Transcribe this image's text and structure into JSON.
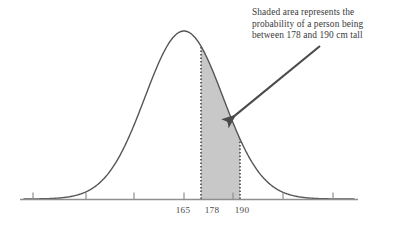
{
  "figure": {
    "title": "",
    "background_color": "#ffffff"
  },
  "annotation": {
    "name": "shaded-area-callout",
    "lines": [
      "Shaded area represents the",
      "probability of a person being",
      "between 178 and 190 cm tall"
    ],
    "full_text": "Shaded area represents the probability of a person being between 178 and 190 cm tall",
    "text_color": "#3a3a3a",
    "arrow": {
      "from_x": 320,
      "from_y": 46,
      "to_x": 221,
      "to_y": 127,
      "color": "#4a4a4a"
    }
  },
  "axis": {
    "line_color": "#8f8f8f",
    "x_start": 20,
    "x_end": 358,
    "baseline_y": 199,
    "tick_color": "#8f8f8f",
    "tick_positions_px": [
      33,
      86,
      134,
      184,
      233,
      283,
      333
    ],
    "labels": [
      {
        "text": "165",
        "x_px": 183
      },
      {
        "text": "178",
        "x_px": 212
      },
      {
        "text": "190",
        "x_px": 242
      }
    ]
  },
  "chart_data": {
    "type": "area",
    "title": "",
    "subtitle": "",
    "xlabel": "",
    "ylabel": "",
    "distribution": "normal",
    "mean": 165,
    "std_dev": 12,
    "peak_px": {
      "x": 184,
      "y": 31
    },
    "curve_color": "#555555",
    "curve_width": 1.4,
    "shaded_region": {
      "from": 178,
      "to": 190,
      "from_x_px": 201,
      "to_x_px": 240,
      "fill_color": "#c8c8c8",
      "boundary_style": "dotted",
      "boundary_color": "#3c3c3c",
      "label": "probability of a person being between 178 and 190 cm tall"
    },
    "x_tick_values": [
      129,
      142,
      153,
      165,
      177,
      190,
      202
    ],
    "x_tick_labels_shown": [
      "165",
      "178",
      "190"
    ],
    "xlim": [
      118,
      208
    ],
    "ylim": [
      0,
      1
    ],
    "grid": false,
    "legend": "none"
  }
}
